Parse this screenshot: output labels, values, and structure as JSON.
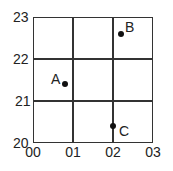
{
  "diagram": {
    "type": "grid-reference",
    "x_ticks": [
      "00",
      "01",
      "02",
      "03"
    ],
    "y_ticks": [
      "23",
      "22",
      "21",
      "20"
    ],
    "points": [
      {
        "label": "A",
        "x": 0.8,
        "y": 21.4
      },
      {
        "label": "B",
        "x": 2.2,
        "y": 22.6
      },
      {
        "label": "C",
        "x": 2.0,
        "y": 20.4
      }
    ]
  }
}
